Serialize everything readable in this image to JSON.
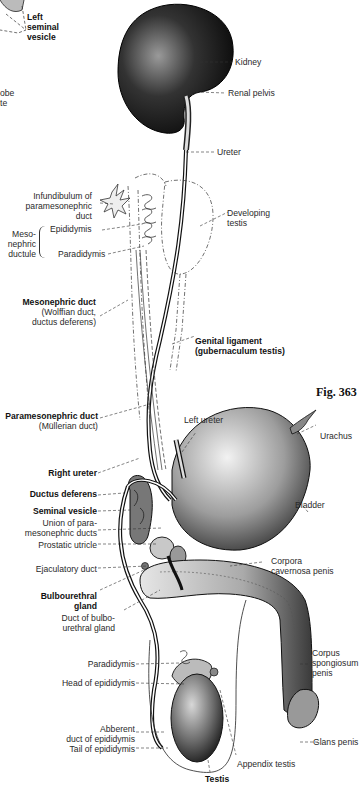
{
  "figure": {
    "number_label": "Fig. 363"
  },
  "labels": {
    "left_seminal_vesicle": [
      "Left",
      "seminal",
      "vesicle"
    ],
    "cut_lobe": [
      "obe",
      "te"
    ],
    "kidney": "Kidney",
    "renal_pelvis": "Renal pelvis",
    "ureter": "Ureter",
    "infundibulum": [
      "Infundibulum of",
      "paramesonephric",
      "duct"
    ],
    "mesonephric_ductule": [
      "Meso-",
      "nephric",
      "ductule"
    ],
    "epididymis": "Epididymis",
    "paradidymis_upper": "Paradidymis",
    "developing_testis": [
      "Developing",
      "testis"
    ],
    "mesonephric_duct_title": "Mesonephric duct",
    "mesonephric_duct_sub": [
      "(Wolffian duct,",
      "ductus deferens)"
    ],
    "genital_ligament": [
      "Genital ligament",
      "(gubernaculum testis)"
    ],
    "paramesonephric_duct_title": "Paramesonephric duct",
    "paramesonephric_duct_sub": "(Müllerian duct)",
    "left_ureter": "Left ureter",
    "urachus": "Urachus",
    "right_ureter": "Right ureter",
    "ductus_deferens": "Ductus deferens",
    "seminal_vesicle": "Seminal vesicle",
    "bladder": "Bladder",
    "union_paramesonephric": [
      "Union of para-",
      "mesonephric ducts"
    ],
    "prostatic_utricle": "Prostatic utricle",
    "ejaculatory_duct": "Ejaculatory duct",
    "corpora_cavernosa": [
      "Corpora",
      "cavernosa penis"
    ],
    "bulbourethral_gland": [
      "Bulbourethral",
      "gland"
    ],
    "duct_bulbourethral": [
      "Duct of bulbo-",
      "urethral gland"
    ],
    "paradidymis_lower": "Paradidymis",
    "head_epididymis": "Head of epididymis",
    "corpus_spongiosum": [
      "Corpus",
      "spongiosum",
      "penis"
    ],
    "abberent_duct": [
      "Abberent",
      "duct of epididymis"
    ],
    "tail_epididymis": "Tail of epididymis",
    "glans_penis": "Glans penis",
    "appendix_testis": "Appendix testis",
    "testis": "Testis"
  },
  "colors": {
    "ink": "#111111",
    "text": "#2a2a2a",
    "background": "#ffffff"
  }
}
